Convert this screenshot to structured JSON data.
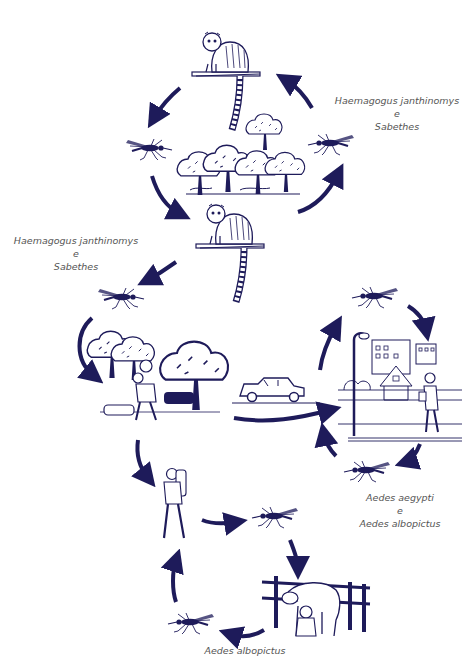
{
  "diagram": {
    "type": "transmission-cycle",
    "ink_color": "#1e1b5a",
    "label_color": "#555555",
    "labels": {
      "sylvatic_right": {
        "line1": "Haemagogus janthinomys",
        "line2": "e",
        "line3": "Sabethes"
      },
      "sylvatic_left": {
        "line1": "Haemagogus janthinomys",
        "line2": "e",
        "line3": "Sabethes"
      },
      "urban": {
        "line1": "Aedes aegypti",
        "line2": "e",
        "line3": "Aedes albopictus"
      },
      "rural": {
        "line1": "Aedes albopictus"
      }
    },
    "nodes": [
      {
        "id": "monkey-top",
        "kind": "monkey on branch"
      },
      {
        "id": "forest",
        "kind": "forest canopy"
      },
      {
        "id": "monkey-middle",
        "kind": "monkey on branch"
      },
      {
        "id": "mosquito-forest-left",
        "kind": "mosquito"
      },
      {
        "id": "mosquito-forest-right",
        "kind": "mosquito"
      },
      {
        "id": "mosquito-edge",
        "kind": "mosquito"
      },
      {
        "id": "forest-edge-worker",
        "kind": "man carrying wood among trees"
      },
      {
        "id": "car",
        "kind": "car"
      },
      {
        "id": "city",
        "kind": "city scene with buildings, house, streetlamp and man"
      },
      {
        "id": "mosquito-city-top",
        "kind": "mosquito"
      },
      {
        "id": "mosquito-city-bottom",
        "kind": "mosquito"
      },
      {
        "id": "hiker",
        "kind": "man with backpack"
      },
      {
        "id": "mosquito-rural-top",
        "kind": "mosquito"
      },
      {
        "id": "cattle-farm",
        "kind": "person milking cow by fence"
      },
      {
        "id": "mosquito-rural-bottom",
        "kind": "mosquito"
      }
    ]
  }
}
